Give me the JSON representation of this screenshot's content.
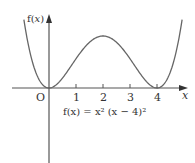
{
  "chart_data": {
    "type": "line",
    "title": "",
    "function": "f(x) = x^2 (x - 4)^2",
    "formula_label": "f(x) = x² (x − 4)²",
    "xlabel": "x",
    "ylabel": "f(x)",
    "origin_label": "O",
    "x_ticks": [
      1,
      2,
      3,
      4
    ],
    "x_tick_labels": [
      "1",
      "2",
      "3",
      "4"
    ],
    "xlim": [
      -1.3,
      5.1
    ],
    "grid": false,
    "series": [
      {
        "name": "f(x) = x^2 (x - 4)^2",
        "x": [
          -0.93,
          -0.75,
          -0.5,
          -0.25,
          0,
          0.25,
          0.5,
          0.75,
          1,
          1.25,
          1.5,
          1.75,
          2,
          2.25,
          2.5,
          2.75,
          3,
          3.25,
          3.5,
          3.75,
          4,
          4.25,
          4.5,
          4.75,
          4.93
        ],
        "y": [
          21.4,
          12.7,
          5.06,
          1.13,
          0,
          0.88,
          3.06,
          5.94,
          9,
          11.82,
          14.06,
          15.5,
          16,
          15.5,
          14.06,
          11.82,
          9,
          5.94,
          3.06,
          0.88,
          0,
          1.13,
          5.06,
          12.7,
          21.4
        ]
      }
    ],
    "key_points": {
      "roots": [
        0,
        4
      ],
      "local_max": {
        "x": 2,
        "y": 16
      }
    },
    "colors": {
      "curve": "#666666",
      "axes": "#555555",
      "text": "#333333"
    }
  }
}
